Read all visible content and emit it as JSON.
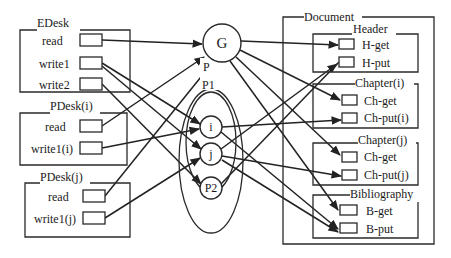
{
  "diagram": {
    "left_groups": [
      {
        "id": "edesk",
        "title": "EDesk",
        "ports": [
          {
            "id": "edesk-read",
            "label": "read"
          },
          {
            "id": "edesk-write1",
            "label": "write1"
          },
          {
            "id": "edesk-write2",
            "label": "write2"
          }
        ]
      },
      {
        "id": "pdesk-i",
        "title": "PDesk(i)",
        "ports": [
          {
            "id": "pdeski-read",
            "label": "read"
          },
          {
            "id": "pdeski-write",
            "label": "write1(i)"
          }
        ]
      },
      {
        "id": "pdesk-j",
        "title": "PDesk(j)",
        "ports": [
          {
            "id": "pdeskj-read",
            "label": "read"
          },
          {
            "id": "pdeskj-write",
            "label": "write1(j)"
          }
        ]
      }
    ],
    "center": {
      "nodes": [
        {
          "id": "G",
          "label": "G"
        },
        {
          "id": "i",
          "label": "i"
        },
        {
          "id": "j",
          "label": "j"
        },
        {
          "id": "P2",
          "label": "P2"
        }
      ],
      "group_outer_label": "P",
      "group_inner_label": "P1"
    },
    "document": {
      "title": "Document",
      "sections": [
        {
          "id": "header",
          "title": "Header",
          "ports": [
            {
              "id": "h-get",
              "label": "H-get"
            },
            {
              "id": "h-put",
              "label": "H-put"
            }
          ]
        },
        {
          "id": "chapter-i",
          "title": "Chapter(i)",
          "ports": [
            {
              "id": "chi-get",
              "label": "Ch-get"
            },
            {
              "id": "chi-put",
              "label": "Ch-put(i)"
            }
          ]
        },
        {
          "id": "chapter-j",
          "title": "Chapter(j)",
          "ports": [
            {
              "id": "chj-get",
              "label": "Ch-get"
            },
            {
              "id": "chj-put",
              "label": "Ch-put(j)"
            }
          ]
        },
        {
          "id": "bibliography",
          "title": "Bibliography",
          "ports": [
            {
              "id": "b-get",
              "label": "B-get"
            },
            {
              "id": "b-put",
              "label": "B-put"
            }
          ]
        }
      ]
    },
    "edges": [
      {
        "from": "edesk-read",
        "to": "G"
      },
      {
        "from": "edesk-write1",
        "to": "i"
      },
      {
        "from": "edesk-write1",
        "to": "j"
      },
      {
        "from": "edesk-write2",
        "to": "P2"
      },
      {
        "from": "pdeski-read",
        "to": "G"
      },
      {
        "from": "pdeski-write",
        "to": "i"
      },
      {
        "from": "pdeskj-read",
        "to": "G"
      },
      {
        "from": "pdeskj-write",
        "to": "j"
      },
      {
        "from": "G",
        "to": "h-get"
      },
      {
        "from": "G",
        "to": "chi-get"
      },
      {
        "from": "G",
        "to": "chj-get"
      },
      {
        "from": "G",
        "to": "b-get"
      },
      {
        "from": "i",
        "to": "chi-put"
      },
      {
        "from": "i",
        "to": "b-put"
      },
      {
        "from": "j",
        "to": "chj-put"
      },
      {
        "from": "j",
        "to": "h-put"
      },
      {
        "from": "j",
        "to": "b-put"
      },
      {
        "from": "P2",
        "to": "h-put"
      }
    ]
  }
}
